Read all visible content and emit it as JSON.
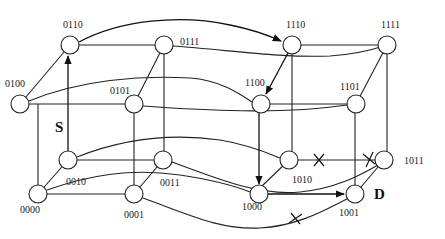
{
  "diagram": {
    "nodes": [
      {
        "id": "0110",
        "label": "0110",
        "x": 70,
        "y": 45,
        "lx": 63,
        "ly": 28
      },
      {
        "id": "0111",
        "label": "0111",
        "x": 164,
        "y": 45,
        "lx": 180,
        "ly": 45
      },
      {
        "id": "1110",
        "label": "1110",
        "x": 292,
        "y": 45,
        "lx": 286,
        "ly": 28
      },
      {
        "id": "1111",
        "label": "1111",
        "x": 387,
        "y": 45,
        "lx": 381,
        "ly": 28
      },
      {
        "id": "0100",
        "label": "0100",
        "x": 20,
        "y": 104,
        "lx": 5,
        "ly": 87
      },
      {
        "id": "0101",
        "label": "0101",
        "x": 134,
        "y": 104,
        "lx": 110,
        "ly": 94
      },
      {
        "id": "1100",
        "label": "1100",
        "x": 261,
        "y": 104,
        "lx": 245,
        "ly": 86
      },
      {
        "id": "1101",
        "label": "1101",
        "x": 356,
        "y": 104,
        "lx": 340,
        "ly": 90
      },
      {
        "id": "0010",
        "label": "0010",
        "x": 68,
        "y": 160,
        "lx": 66,
        "ly": 185
      },
      {
        "id": "0011",
        "label": "0011",
        "x": 163,
        "y": 160,
        "lx": 160,
        "ly": 186
      },
      {
        "id": "1010",
        "label": "1010",
        "x": 289,
        "y": 160,
        "lx": 292,
        "ly": 183
      },
      {
        "id": "1011",
        "label": "1011",
        "x": 384,
        "y": 160,
        "lx": 404,
        "ly": 164
      },
      {
        "id": "0000",
        "label": "0000",
        "x": 38,
        "y": 194,
        "lx": 20,
        "ly": 213
      },
      {
        "id": "0001",
        "label": "0001",
        "x": 134,
        "y": 194,
        "lx": 124,
        "ly": 218
      },
      {
        "id": "1000",
        "label": "1000",
        "x": 259,
        "y": 194,
        "lx": 242,
        "ly": 210
      },
      {
        "id": "1001",
        "label": "1001",
        "x": 355,
        "y": 194,
        "lx": 339,
        "ly": 216
      }
    ],
    "node_radius": 9,
    "source_label": {
      "text": "S",
      "x": 55,
      "y": 130
    },
    "destination_label": {
      "text": "D",
      "x": 376,
      "y": 198
    },
    "faulty_links": [
      "1010-1011",
      "1011-1001",
      "0001-1001"
    ],
    "route": [
      "0010",
      "0110",
      "1110",
      "1100",
      "1000",
      "1001"
    ]
  }
}
